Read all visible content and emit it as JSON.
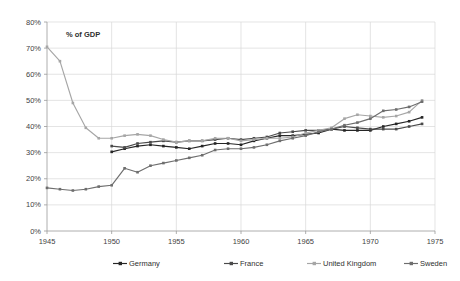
{
  "chart_data": {
    "type": "line",
    "title": "",
    "subtitle": "",
    "axis_note": "% of GDP",
    "xlabel": "",
    "ylabel": "",
    "xlim": [
      1945,
      1975
    ],
    "ylim": [
      0,
      80
    ],
    "grid": true,
    "legend_position": "bottom",
    "x_tick_labels": [
      "1945",
      "1950",
      "1955",
      "1960",
      "1965",
      "1970",
      "1975"
    ],
    "x_ticks": [
      1945,
      1950,
      1955,
      1960,
      1965,
      1970,
      1975
    ],
    "y_tick_labels": [
      "0%",
      "10%",
      "20%",
      "30%",
      "40%",
      "50%",
      "60%",
      "70%",
      "80%"
    ],
    "y_ticks": [
      0,
      10,
      20,
      30,
      40,
      50,
      60,
      70,
      80
    ],
    "series": [
      {
        "name": "Germany",
        "color": "#262626",
        "x": [
          1950,
          1951,
          1952,
          1953,
          1954,
          1955,
          1956,
          1957,
          1958,
          1959,
          1960,
          1961,
          1962,
          1963,
          1964,
          1965,
          1966,
          1967,
          1968,
          1969,
          1970,
          1971,
          1972,
          1973,
          1974
        ],
        "values": [
          30.3,
          31.5,
          32.5,
          33.0,
          32.5,
          32.0,
          31.5,
          32.5,
          33.5,
          33.5,
          33.0,
          34.5,
          35.5,
          36.5,
          36.5,
          37.0,
          37.5,
          39.0,
          38.5,
          38.5,
          38.5,
          40.0,
          41.0,
          42.0,
          43.5
        ]
      },
      {
        "name": "France",
        "color": "#4a4a4a",
        "x": [
          1950,
          1951,
          1952,
          1953,
          1954,
          1955,
          1956,
          1957,
          1958,
          1959,
          1960,
          1961,
          1962,
          1963,
          1964,
          1965,
          1966,
          1967,
          1968,
          1969,
          1970,
          1971,
          1972,
          1973,
          1974
        ],
        "values": [
          32.5,
          32.0,
          33.5,
          34.0,
          34.5,
          34.0,
          34.5,
          34.5,
          35.0,
          35.5,
          35.0,
          35.5,
          36.0,
          37.5,
          38.0,
          38.5,
          38.5,
          39.0,
          40.0,
          39.5,
          39.0,
          39.0,
          39.0,
          40.0,
          41.0
        ]
      },
      {
        "name": "United Kingdom",
        "color": "#a6a6a6",
        "x": [
          1945,
          1946,
          1947,
          1948,
          1949,
          1950,
          1951,
          1952,
          1953,
          1954,
          1955,
          1956,
          1957,
          1958,
          1959,
          1960,
          1961,
          1962,
          1963,
          1964,
          1965,
          1966,
          1967,
          1968,
          1969,
          1970,
          1971,
          1972,
          1973,
          1974
        ],
        "values": [
          70.5,
          65.0,
          49.0,
          39.5,
          35.5,
          35.5,
          36.5,
          37.0,
          36.5,
          35.0,
          34.0,
          34.5,
          34.5,
          35.5,
          35.5,
          34.5,
          35.0,
          35.5,
          35.5,
          36.0,
          37.5,
          38.5,
          39.5,
          43.0,
          44.5,
          44.0,
          43.5,
          44.0,
          45.5,
          50.0
        ]
      },
      {
        "name": "Sweden",
        "color": "#6e6e6e",
        "x": [
          1945,
          1946,
          1947,
          1948,
          1949,
          1950,
          1951,
          1952,
          1953,
          1954,
          1955,
          1956,
          1957,
          1958,
          1959,
          1960,
          1961,
          1962,
          1963,
          1964,
          1965,
          1966,
          1967,
          1968,
          1969,
          1970,
          1971,
          1972,
          1973,
          1974
        ],
        "values": [
          16.5,
          16.0,
          15.5,
          16.0,
          17.0,
          17.5,
          24.0,
          22.5,
          25.0,
          26.0,
          27.0,
          28.0,
          29.0,
          31.0,
          31.5,
          31.5,
          32.0,
          33.0,
          34.5,
          35.5,
          36.5,
          38.0,
          39.0,
          40.5,
          41.5,
          43.0,
          46.0,
          46.5,
          47.5,
          49.5
        ]
      }
    ]
  },
  "legend": {
    "items": [
      {
        "label": "Germany",
        "color": "#262626"
      },
      {
        "label": "France",
        "color": "#4a4a4a"
      },
      {
        "label": "United Kingdom",
        "color": "#a6a6a6"
      },
      {
        "label": "Sweden",
        "color": "#6e6e6e"
      }
    ]
  }
}
